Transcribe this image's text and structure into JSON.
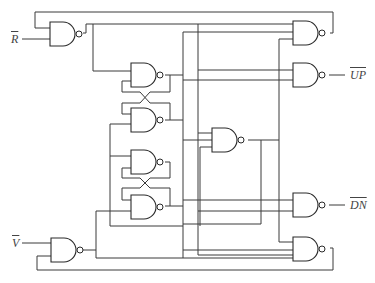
{
  "diagram": {
    "type": "logic-circuit",
    "inputs": [
      {
        "id": "R",
        "label": "R",
        "negated": true
      },
      {
        "id": "V",
        "label": "V",
        "negated": true
      }
    ],
    "outputs": [
      {
        "id": "UP",
        "label": "UP",
        "negated": true
      },
      {
        "id": "DN",
        "label": "DN",
        "negated": true
      }
    ],
    "gate_type": "NAND",
    "gate_count": 11,
    "latches": [
      {
        "name": "upper-latch",
        "gates": [
          "latch-gate-a",
          "latch-gate-b"
        ]
      },
      {
        "name": "lower-latch",
        "gates": [
          "latch-gate-c",
          "latch-gate-d"
        ]
      }
    ]
  },
  "labels": {
    "r_bar": "R",
    "v_bar": "V",
    "up_bar": "UP",
    "dn_bar": "DN"
  },
  "colors": {
    "line": "#3a3a3a",
    "background": "#ffffff"
  }
}
